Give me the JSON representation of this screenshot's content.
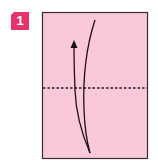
{
  "step": {
    "number": "1",
    "badge_color": "#E8326A"
  },
  "paper": {
    "fill_color": "#F9C9D9",
    "border_color": "#3a2a30",
    "x": 42,
    "y": 12,
    "width": 105,
    "height": 146
  },
  "fold_line": {
    "type": "valley-fold",
    "style": "dashed",
    "y": 88
  },
  "arrow": {
    "direction": "up",
    "meaning": "fold bottom edge up to top"
  }
}
